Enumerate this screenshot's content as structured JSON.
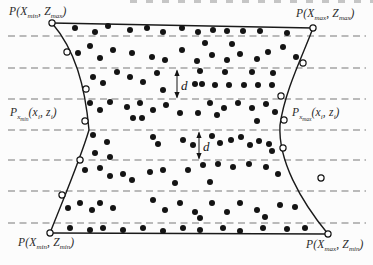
{
  "figure_meta": {
    "background": "#fcfcfc",
    "ink": "#141414",
    "dash_color": "#787878"
  },
  "labels": {
    "top_left": {
      "pre": "P(X",
      "sub1": "min",
      "mid": ", Z",
      "sub2": "max",
      "post": ")"
    },
    "top_right": {
      "pre": "P(X",
      "sub1": "max",
      "mid": ", Z",
      "sub2": "max",
      "post": ")"
    },
    "bottom_left": {
      "pre": "P(X",
      "sub1": "min",
      "mid": ", Z",
      "sub2": "min",
      "post": ")"
    },
    "bottom_right": {
      "pre": "P(X",
      "sub1": "max",
      "mid": ", Z",
      "sub2": "min",
      "post": ")"
    },
    "mid_left": {
      "p": "P",
      "ps": "x",
      "pss": "min",
      "a1": "(x",
      "s1": "i",
      "a2": ", z",
      "s2": "i",
      "a3": ")"
    },
    "mid_right": {
      "p": "P",
      "ps": "x",
      "pss": "max",
      "a1": "(x",
      "s1": "i",
      "a2": ", z",
      "s2": "i",
      "a3": ")"
    }
  },
  "diagram": {
    "slice_lines": {
      "x1": 8,
      "x2": 366,
      "y": [
        36,
        68,
        99,
        130,
        160,
        191,
        223
      ]
    },
    "boundary": {
      "top_path": "M52,23 L313,28",
      "bottom_path": "M50,233 L328,234",
      "left_path": "M52,23 C75,50 85,85 89,130 C80,160 65,195 50,233",
      "right_path": "M313,28 C303,55 285,90 280,125 C278,160 300,200 328,234"
    },
    "dimension_markers": [
      {
        "label": "d",
        "x": 177,
        "y1": 69,
        "y2": 99,
        "lx": 181,
        "ly": 90
      },
      {
        "label": "d",
        "x": 199,
        "y1": 131,
        "y2": 160,
        "lx": 203,
        "ly": 151
      }
    ],
    "points": {
      "filled": [
        [
          75,
          28
        ],
        [
          95,
          32
        ],
        [
          108,
          26
        ],
        [
          130,
          30
        ],
        [
          147,
          28
        ],
        [
          163,
          32
        ],
        [
          182,
          28
        ],
        [
          198,
          32
        ],
        [
          213,
          30
        ],
        [
          227,
          31
        ],
        [
          243,
          31
        ],
        [
          260,
          31
        ],
        [
          287,
          33
        ],
        [
          78,
          53
        ],
        [
          90,
          46
        ],
        [
          100,
          58
        ],
        [
          113,
          50
        ],
        [
          132,
          53
        ],
        [
          152,
          57
        ],
        [
          165,
          60
        ],
        [
          182,
          50
        ],
        [
          197,
          61
        ],
        [
          205,
          43
        ],
        [
          212,
          55
        ],
        [
          227,
          60
        ],
        [
          232,
          44
        ],
        [
          240,
          54
        ],
        [
          257,
          59
        ],
        [
          268,
          52
        ],
        [
          283,
          47
        ],
        [
          296,
          57
        ],
        [
          93,
          77
        ],
        [
          103,
          83
        ],
        [
          117,
          72
        ],
        [
          130,
          77
        ],
        [
          143,
          82
        ],
        [
          157,
          73
        ],
        [
          163,
          90
        ],
        [
          195,
          84
        ],
        [
          202,
          84
        ],
        [
          215,
          85
        ],
        [
          229,
          85
        ],
        [
          244,
          85
        ],
        [
          258,
          85
        ],
        [
          272,
          85
        ],
        [
          200,
          71
        ],
        [
          225,
          72
        ],
        [
          252,
          72
        ],
        [
          273,
          73
        ],
        [
          90,
          103
        ],
        [
          100,
          110
        ],
        [
          110,
          102
        ],
        [
          127,
          107
        ],
        [
          140,
          103
        ],
        [
          153,
          110
        ],
        [
          166,
          105
        ],
        [
          180,
          113
        ],
        [
          198,
          113
        ],
        [
          210,
          103
        ],
        [
          217,
          115
        ],
        [
          224,
          108
        ],
        [
          238,
          103
        ],
        [
          252,
          108
        ],
        [
          266,
          104
        ],
        [
          133,
          118
        ],
        [
          142,
          118
        ],
        [
          257,
          121
        ],
        [
          275,
          112
        ],
        [
          93,
          135
        ],
        [
          107,
          142
        ],
        [
          95,
          153
        ],
        [
          110,
          157
        ],
        [
          153,
          137
        ],
        [
          158,
          144
        ],
        [
          183,
          140
        ],
        [
          193,
          145
        ],
        [
          212,
          136
        ],
        [
          220,
          143
        ],
        [
          231,
          140
        ],
        [
          241,
          137
        ],
        [
          250,
          145
        ],
        [
          259,
          141
        ],
        [
          269,
          144
        ],
        [
          272,
          151
        ],
        [
          85,
          170
        ],
        [
          100,
          168
        ],
        [
          110,
          176
        ],
        [
          123,
          174
        ],
        [
          132,
          180
        ],
        [
          150,
          172
        ],
        [
          163,
          170
        ],
        [
          175,
          183
        ],
        [
          188,
          170
        ],
        [
          203,
          165
        ],
        [
          210,
          182
        ],
        [
          218,
          164
        ],
        [
          233,
          167
        ],
        [
          249,
          164
        ],
        [
          266,
          167
        ],
        [
          278,
          174
        ],
        [
          68,
          208
        ],
        [
          80,
          203
        ],
        [
          92,
          210
        ],
        [
          100,
          203
        ],
        [
          113,
          208
        ],
        [
          153,
          200
        ],
        [
          165,
          210
        ],
        [
          180,
          203
        ],
        [
          195,
          212
        ],
        [
          200,
          218
        ],
        [
          212,
          203
        ],
        [
          227,
          212
        ],
        [
          240,
          203
        ],
        [
          257,
          210
        ],
        [
          265,
          217
        ],
        [
          280,
          205
        ],
        [
          295,
          207
        ],
        [
          70,
          228
        ],
        [
          90,
          230
        ],
        [
          103,
          228
        ],
        [
          123,
          230
        ],
        [
          143,
          228
        ],
        [
          163,
          231
        ],
        [
          183,
          228
        ],
        [
          200,
          230
        ],
        [
          223,
          228
        ],
        [
          240,
          231
        ],
        [
          263,
          228
        ],
        [
          287,
          229
        ],
        [
          305,
          228
        ]
      ],
      "open": [
        [
          52,
          23
        ],
        [
          67,
          52
        ],
        [
          86,
          89
        ],
        [
          85,
          121
        ],
        [
          80,
          160
        ],
        [
          62,
          195
        ],
        [
          50,
          233
        ],
        [
          313,
          28
        ],
        [
          303,
          63
        ],
        [
          281,
          96
        ],
        [
          284,
          120
        ],
        [
          283,
          148
        ],
        [
          321,
          178
        ],
        [
          328,
          234
        ]
      ]
    }
  }
}
